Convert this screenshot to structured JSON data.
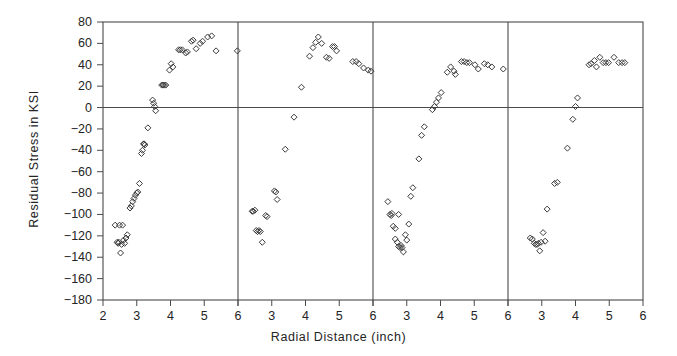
{
  "chart_data": {
    "type": "scatter",
    "title": "",
    "xlabel": "Radial Distance (inch)",
    "ylabel": "Residual Stress in KSI",
    "ylim": [
      -180,
      80
    ],
    "ytick_step": 20,
    "yticks": [
      "80",
      "60",
      "40",
      "20",
      "0",
      "-20",
      "-40",
      "-60",
      "-80",
      "-100",
      "-120",
      "-140",
      "-160",
      "-180"
    ],
    "ytick_values": [
      80,
      60,
      40,
      20,
      0,
      -20,
      -40,
      -60,
      -80,
      -100,
      -120,
      -140,
      -160,
      -180
    ],
    "xlim_per_panel": [
      2,
      6
    ],
    "xticks": [
      "2",
      "3",
      "4",
      "5",
      "6"
    ],
    "xtick_values": [
      2,
      3,
      4,
      5,
      6
    ],
    "panel_count": 4,
    "grid": false,
    "legend": "none",
    "marker": "open-diamond",
    "zero_reference_line": 0,
    "series": [
      {
        "name": "panel-1",
        "panel": 1,
        "points": [
          [
            2.36,
            -110
          ],
          [
            2.42,
            -126
          ],
          [
            2.45,
            -127
          ],
          [
            2.47,
            -126
          ],
          [
            2.49,
            -110
          ],
          [
            2.52,
            -136
          ],
          [
            2.55,
            -128
          ],
          [
            2.58,
            -110
          ],
          [
            2.61,
            -124
          ],
          [
            2.64,
            -127
          ],
          [
            2.68,
            -122
          ],
          [
            2.72,
            -119
          ],
          [
            2.8,
            -94
          ],
          [
            2.84,
            -92
          ],
          [
            2.88,
            -88
          ],
          [
            2.92,
            -85
          ],
          [
            2.96,
            -82
          ],
          [
            3.0,
            -80
          ],
          [
            3.03,
            -79
          ],
          [
            3.08,
            -71
          ],
          [
            3.14,
            -43
          ],
          [
            3.17,
            -40
          ],
          [
            3.2,
            -34
          ],
          [
            3.22,
            -34
          ],
          [
            3.24,
            -35
          ],
          [
            3.33,
            -19
          ],
          [
            3.47,
            7
          ],
          [
            3.5,
            4
          ],
          [
            3.53,
            1
          ],
          [
            3.56,
            -3
          ],
          [
            3.74,
            21
          ],
          [
            3.78,
            21
          ],
          [
            3.82,
            21
          ],
          [
            3.86,
            21
          ],
          [
            3.97,
            35
          ],
          [
            4.02,
            41
          ],
          [
            4.07,
            38
          ],
          [
            4.24,
            54
          ],
          [
            4.29,
            54
          ],
          [
            4.35,
            54
          ],
          [
            4.45,
            51
          ],
          [
            4.5,
            52
          ],
          [
            4.62,
            62
          ],
          [
            4.67,
            63
          ],
          [
            4.76,
            55
          ],
          [
            4.88,
            60
          ],
          [
            4.95,
            62
          ],
          [
            5.1,
            66
          ],
          [
            5.22,
            67
          ],
          [
            5.35,
            53
          ],
          [
            5.98,
            53
          ]
        ]
      },
      {
        "name": "panel-2",
        "panel": 2,
        "points": [
          [
            2.42,
            -97
          ],
          [
            2.45,
            -97
          ],
          [
            2.5,
            -96
          ],
          [
            2.54,
            -115
          ],
          [
            2.58,
            -116
          ],
          [
            2.62,
            -115
          ],
          [
            2.66,
            -116
          ],
          [
            2.72,
            -126
          ],
          [
            2.82,
            -101
          ],
          [
            2.86,
            -102
          ],
          [
            3.08,
            -78
          ],
          [
            3.12,
            -79
          ],
          [
            3.16,
            -86
          ],
          [
            3.4,
            -39
          ],
          [
            3.66,
            -9
          ],
          [
            3.88,
            19
          ],
          [
            4.12,
            48
          ],
          [
            4.22,
            56
          ],
          [
            4.3,
            61
          ],
          [
            4.38,
            66
          ],
          [
            4.48,
            60
          ],
          [
            4.62,
            47
          ],
          [
            4.7,
            46
          ],
          [
            4.8,
            57
          ],
          [
            4.86,
            57
          ],
          [
            4.92,
            53
          ],
          [
            5.4,
            43
          ],
          [
            5.5,
            43
          ],
          [
            5.58,
            41
          ],
          [
            5.72,
            37
          ],
          [
            5.86,
            35
          ],
          [
            5.94,
            34
          ]
        ]
      },
      {
        "name": "panel-3",
        "panel": 3,
        "points": [
          [
            2.44,
            -88
          ],
          [
            2.5,
            -100
          ],
          [
            2.54,
            -101
          ],
          [
            2.56,
            -99
          ],
          [
            2.6,
            -111
          ],
          [
            2.66,
            -123
          ],
          [
            2.72,
            -126
          ],
          [
            2.76,
            -130
          ],
          [
            2.8,
            -131
          ],
          [
            2.83,
            -129
          ],
          [
            2.86,
            -131
          ],
          [
            2.9,
            -135
          ],
          [
            2.66,
            -113
          ],
          [
            2.76,
            -100
          ],
          [
            2.96,
            -119
          ],
          [
            3.0,
            -124
          ],
          [
            3.06,
            -109
          ],
          [
            3.12,
            -83
          ],
          [
            3.18,
            -75
          ],
          [
            3.36,
            -48
          ],
          [
            3.44,
            -26
          ],
          [
            3.52,
            -18
          ],
          [
            3.76,
            -2
          ],
          [
            3.82,
            1
          ],
          [
            3.88,
            5
          ],
          [
            3.94,
            9
          ],
          [
            4.02,
            14
          ],
          [
            4.2,
            33
          ],
          [
            4.3,
            38
          ],
          [
            4.4,
            34
          ],
          [
            4.44,
            31
          ],
          [
            4.62,
            43
          ],
          [
            4.7,
            43
          ],
          [
            4.78,
            42
          ],
          [
            4.86,
            42
          ],
          [
            5.02,
            40
          ],
          [
            5.12,
            36
          ],
          [
            5.3,
            41
          ],
          [
            5.4,
            40
          ],
          [
            5.52,
            38
          ],
          [
            5.86,
            36
          ]
        ]
      },
      {
        "name": "panel-4",
        "panel": 4,
        "points": [
          [
            2.66,
            -122
          ],
          [
            2.72,
            -123
          ],
          [
            2.78,
            -127
          ],
          [
            2.82,
            -128
          ],
          [
            2.86,
            -128
          ],
          [
            2.9,
            -127
          ],
          [
            2.94,
            -134
          ],
          [
            2.98,
            -126
          ],
          [
            3.04,
            -117
          ],
          [
            3.1,
            -125
          ],
          [
            3.16,
            -95
          ],
          [
            3.38,
            -71
          ],
          [
            3.46,
            -70
          ],
          [
            3.76,
            -38
          ],
          [
            3.92,
            -11
          ],
          [
            4.0,
            1
          ],
          [
            4.06,
            9
          ],
          [
            4.4,
            40
          ],
          [
            4.46,
            41
          ],
          [
            4.56,
            44
          ],
          [
            4.62,
            38
          ],
          [
            4.72,
            47
          ],
          [
            4.82,
            42
          ],
          [
            4.9,
            42
          ],
          [
            4.98,
            42
          ],
          [
            5.14,
            47
          ],
          [
            5.28,
            42
          ],
          [
            5.38,
            42
          ],
          [
            5.46,
            42
          ]
        ]
      }
    ]
  },
  "axis": {
    "xlabel": "Radial Distance (inch)",
    "ylabel": "Residual Stress in KSI"
  }
}
